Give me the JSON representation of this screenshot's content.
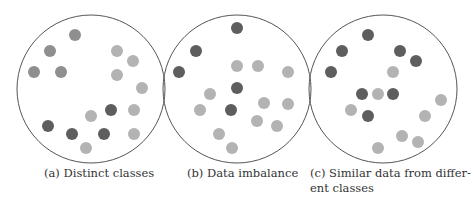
{
  "figure": {
    "circle_stroke": "#555555",
    "colors": {
      "dark": "#5e5e5e",
      "medium": "#8f8f8f",
      "light": "#b3b3b3"
    },
    "panels": [
      {
        "id": "a",
        "caption": "(a) Distinct classes",
        "circle": {
          "cx": 91,
          "cy": 89,
          "r": 74
        },
        "dots": [
          {
            "x": 75,
            "y": 35,
            "c": "medium"
          },
          {
            "x": 50,
            "y": 51,
            "c": "medium"
          },
          {
            "x": 34,
            "y": 72,
            "c": "medium"
          },
          {
            "x": 61,
            "y": 72,
            "c": "medium"
          },
          {
            "x": 117,
            "y": 51,
            "c": "light"
          },
          {
            "x": 133,
            "y": 61,
            "c": "light"
          },
          {
            "x": 117,
            "y": 75,
            "c": "light"
          },
          {
            "x": 142,
            "y": 88,
            "c": "light"
          },
          {
            "x": 111,
            "y": 110,
            "c": "dark"
          },
          {
            "x": 91,
            "y": 116,
            "c": "light"
          },
          {
            "x": 134,
            "y": 110,
            "c": "light"
          },
          {
            "x": 48,
            "y": 126,
            "c": "dark"
          },
          {
            "x": 72,
            "y": 134,
            "c": "dark"
          },
          {
            "x": 104,
            "y": 134,
            "c": "dark"
          },
          {
            "x": 134,
            "y": 134,
            "c": "light"
          },
          {
            "x": 86,
            "y": 148,
            "c": "light"
          }
        ]
      },
      {
        "id": "b",
        "caption": "(b) Data imbalance",
        "circle": {
          "cx": 237,
          "cy": 89,
          "r": 74
        },
        "dots": [
          {
            "x": 237,
            "y": 28,
            "c": "dark"
          },
          {
            "x": 196,
            "y": 51,
            "c": "dark"
          },
          {
            "x": 179,
            "y": 72,
            "c": "dark"
          },
          {
            "x": 237,
            "y": 66,
            "c": "light"
          },
          {
            "x": 258,
            "y": 66,
            "c": "light"
          },
          {
            "x": 288,
            "y": 72,
            "c": "light"
          },
          {
            "x": 237,
            "y": 88,
            "c": "dark"
          },
          {
            "x": 210,
            "y": 94,
            "c": "light"
          },
          {
            "x": 264,
            "y": 103,
            "c": "light"
          },
          {
            "x": 288,
            "y": 104,
            "c": "light"
          },
          {
            "x": 200,
            "y": 110,
            "c": "light"
          },
          {
            "x": 231,
            "y": 110,
            "c": "dark"
          },
          {
            "x": 257,
            "y": 121,
            "c": "light"
          },
          {
            "x": 277,
            "y": 126,
            "c": "light"
          },
          {
            "x": 219,
            "y": 134,
            "c": "light"
          },
          {
            "x": 232,
            "y": 148,
            "c": "light"
          }
        ]
      },
      {
        "id": "c",
        "caption": "(c) Similar data from different classes",
        "caption_lines": [
          "(c) Similar data from differ-",
          "ent classes"
        ],
        "circle": {
          "cx": 383,
          "cy": 89,
          "r": 74
        },
        "dots": [
          {
            "x": 368,
            "y": 35,
            "c": "dark"
          },
          {
            "x": 342,
            "y": 51,
            "c": "dark"
          },
          {
            "x": 400,
            "y": 51,
            "c": "dark"
          },
          {
            "x": 416,
            "y": 61,
            "c": "dark"
          },
          {
            "x": 331,
            "y": 72,
            "c": "dark"
          },
          {
            "x": 393,
            "y": 72,
            "c": "light"
          },
          {
            "x": 362,
            "y": 94,
            "c": "dark"
          },
          {
            "x": 378,
            "y": 94,
            "c": "light"
          },
          {
            "x": 393,
            "y": 94,
            "c": "dark"
          },
          {
            "x": 441,
            "y": 100,
            "c": "light"
          },
          {
            "x": 351,
            "y": 110,
            "c": "light"
          },
          {
            "x": 368,
            "y": 116,
            "c": "dark"
          },
          {
            "x": 425,
            "y": 116,
            "c": "light"
          },
          {
            "x": 402,
            "y": 136,
            "c": "light"
          },
          {
            "x": 418,
            "y": 142,
            "c": "light"
          },
          {
            "x": 378,
            "y": 148,
            "c": "light"
          }
        ]
      }
    ]
  }
}
